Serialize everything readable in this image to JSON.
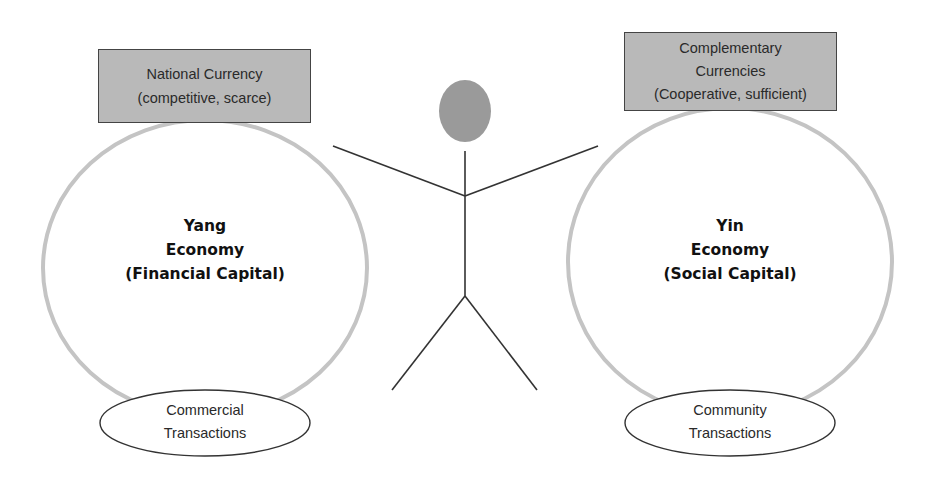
{
  "diagram": {
    "left": {
      "currency_box": {
        "line1": "National Currency",
        "line2": "(competitive, scarce)"
      },
      "economy": {
        "line1": "Yang",
        "line2": "Economy",
        "line3": "(Financial Capital)"
      },
      "transactions": {
        "line1": "Commercial",
        "line2": "Transactions"
      }
    },
    "right": {
      "currency_box": {
        "line1": "Complementary",
        "line2": "Currencies",
        "line3": "(Cooperative, sufficient)"
      },
      "economy": {
        "line1": "Yin",
        "line2": "Economy",
        "line3": "(Social Capital)"
      },
      "transactions": {
        "line1": "Community",
        "line2": "Transactions"
      }
    },
    "center": {
      "figure": "stick-figure-person"
    },
    "colors": {
      "box_fill": "#b9b9b9",
      "circle_stroke": "#c4c4c4",
      "head_fill": "#9a9a9a",
      "line_stroke": "#333333"
    }
  }
}
